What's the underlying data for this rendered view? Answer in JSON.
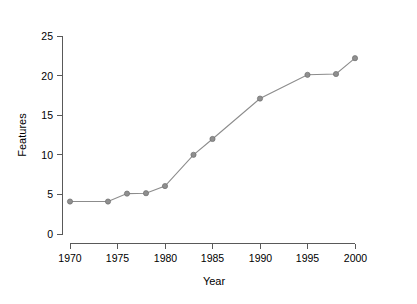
{
  "chart_data": {
    "type": "line",
    "title": "",
    "xlabel": "Year",
    "ylabel": "Features",
    "xlim": [
      1968,
      2001
    ],
    "ylim": [
      0,
      25
    ],
    "grid": false,
    "legend": null,
    "x": [
      1970,
      1974,
      1976,
      1978,
      1980,
      1983,
      1985,
      1990,
      1995,
      1998,
      2000
    ],
    "values": [
      4.1,
      4.1,
      5.1,
      5.15,
      6.05,
      10.0,
      12.0,
      17.1,
      20.1,
      20.2,
      22.2
    ],
    "series": [
      {
        "name": "Features",
        "x": [
          1970,
          1974,
          1976,
          1978,
          1980,
          1983,
          1985,
          1990,
          1995,
          1998,
          2000
        ],
        "values": [
          4.1,
          4.1,
          5.1,
          5.15,
          6.05,
          10.0,
          12.0,
          17.1,
          20.1,
          20.2,
          22.2
        ]
      }
    ],
    "xticks": [
      1970,
      1975,
      1980,
      1985,
      1990,
      1995,
      2000
    ],
    "xticklabels": [
      "1970",
      "1975",
      "1980",
      "1985",
      "1990",
      "1995",
      "2000"
    ],
    "yticks": [
      0,
      5,
      10,
      15,
      20,
      25
    ],
    "yticklabels": [
      "0",
      "5",
      "10",
      "15",
      "20",
      "25"
    ],
    "line_color": "#8c8c8c",
    "marker_color": "#8f8f8f",
    "marker_shape": "circle",
    "background_color": "#ffffff",
    "axis_color": "#595959",
    "text_color": "#000000"
  },
  "axes": {
    "x_label": "Year",
    "y_label": "Features"
  },
  "ticks": {
    "y": {
      "t0": "0",
      "t1": "5",
      "t2": "10",
      "t3": "15",
      "t4": "20",
      "t5": "25"
    },
    "x": {
      "t0": "1970",
      "t1": "1975",
      "t2": "1980",
      "t3": "1985",
      "t4": "1990",
      "t5": "1995",
      "t6": "2000"
    }
  }
}
